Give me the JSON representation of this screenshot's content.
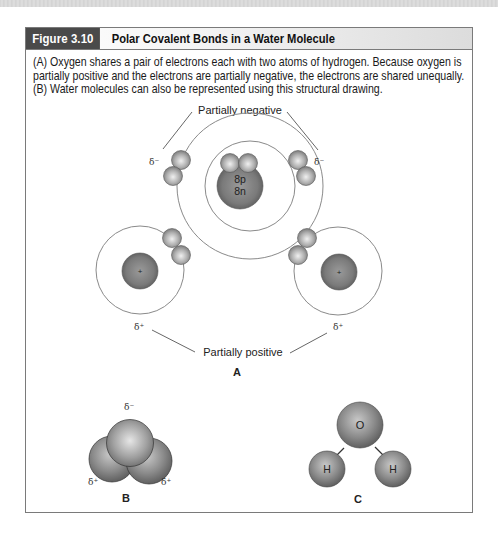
{
  "figure": {
    "number_label": "Figure 3.10",
    "title": "Polar Covalent Bonds in a Water Molecule",
    "caption_lines": [
      "(A) Oxygen shares a pair of electrons each with two atoms of hydrogen. Because oxygen is",
      "partially positive and the electrons are partially negative, the electrons are shared unequally.",
      "(B) Water molecules can also be represented using this structural drawing."
    ]
  },
  "panel_a": {
    "label": "A",
    "annotation_top": "Partially negative",
    "annotation_bottom": "Partially positive",
    "oxygen_nucleus": [
      "8p",
      "8n"
    ],
    "hydrogen_nucleus_symbol": "+",
    "delta_negative": "δ⁻",
    "delta_positive": "δ⁺"
  },
  "panel_b": {
    "label": "B",
    "delta_negative": "δ⁻",
    "delta_positive": "δ⁺"
  },
  "panel_c": {
    "label": "C",
    "oxygen": "O",
    "hydrogen": "H"
  },
  "colors": {
    "header_label_bg": "#4a4a4a",
    "frame_border": "#7a7a7a",
    "sphere_dark": "#6a6a6a",
    "sphere_light": "#d8d8d8",
    "orbit_stroke": "#8a8a8a"
  }
}
